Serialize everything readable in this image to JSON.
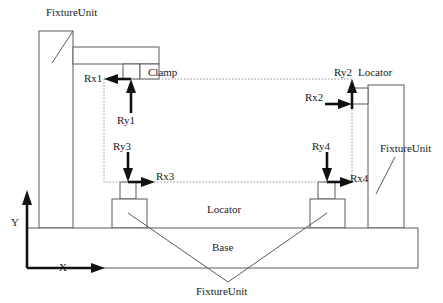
{
  "figure": {
    "background_color": "#ffffff",
    "outline_color": "#5a5a5a",
    "workpiece_outline_color": "#9a9a9a",
    "arrow_color": "#111111"
  },
  "axes": {
    "y_label": "Y",
    "x_label": "X",
    "origin": {
      "x": 27,
      "y": 268
    }
  },
  "part_labels": {
    "fixture_unit_top": "FixtureUnit",
    "fixture_unit_right": "FixtureUnit",
    "fixture_unit_bottom": "FixtureUnit",
    "clamp": "Clamp",
    "locator_top_right": "Locator",
    "locator_middle": "Locator",
    "base": "Base"
  },
  "force_labels": {
    "rx1": "Rx1",
    "ry1": "Ry1",
    "rx2": "Rx2",
    "ry2": "Ry2",
    "rx3": "Rx3",
    "ry3": "Ry3",
    "rx4": "Rx4",
    "ry4": "Ry4"
  },
  "forces": [
    {
      "name": "Rx1",
      "direction": "left",
      "at": {
        "x": 131,
        "y": 79
      }
    },
    {
      "name": "Ry1",
      "direction": "up",
      "at": {
        "x": 131,
        "y": 79
      }
    },
    {
      "name": "Rx2",
      "direction": "right",
      "at": {
        "x": 352,
        "y": 104
      }
    },
    {
      "name": "Ry2",
      "direction": "up",
      "at": {
        "x": 352,
        "y": 104
      }
    },
    {
      "name": "Rx3",
      "direction": "right",
      "at": {
        "x": 128,
        "y": 182
      }
    },
    {
      "name": "Ry3",
      "direction": "down",
      "at": {
        "x": 128,
        "y": 182
      }
    },
    {
      "name": "Rx4",
      "direction": "right",
      "at": {
        "x": 327,
        "y": 182
      }
    },
    {
      "name": "Ry4",
      "direction": "down",
      "at": {
        "x": 327,
        "y": 182
      }
    }
  ],
  "workpiece": {
    "shape": "dashed-rectangle",
    "x": 104,
    "y": 79,
    "width": 248,
    "height": 103
  }
}
